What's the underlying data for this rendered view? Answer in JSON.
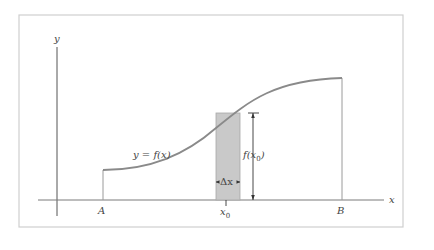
{
  "diagram": {
    "axes": {
      "x_label": "x",
      "y_label": "y"
    },
    "curve": {
      "label": "y = f(x)",
      "start_label": "A",
      "end_label": "B"
    },
    "strip": {
      "center_label_main": "x",
      "center_label_sub": "0",
      "width_label": "Δx",
      "height_label_prefix": "f(x",
      "height_label_sub": "0",
      "height_label_suffix": ")"
    },
    "colors": {
      "curve": "#8a8a8a",
      "strip_fill": "#c9c9c9",
      "axis": "#555555",
      "frame": "#cfcfcf"
    }
  }
}
